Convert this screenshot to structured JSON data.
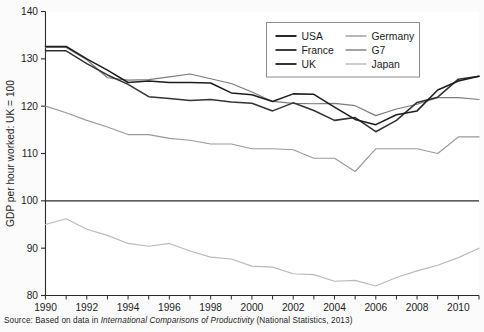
{
  "caption": {
    "prefix": "Source: Based on data in ",
    "italic_title": "International Comparisons of Productivity",
    "suffix": " (National Statistics, 2013)"
  },
  "chart_data": {
    "type": "line",
    "title": "",
    "xlabel": "",
    "ylabel": "GDP per hour worked: UK = 100",
    "xlim": [
      1990,
      2011
    ],
    "ylim": [
      80,
      140
    ],
    "yticks": [
      80,
      90,
      100,
      110,
      120,
      130,
      140
    ],
    "xticks": [
      1990,
      1992,
      1994,
      1996,
      1998,
      2000,
      2002,
      2004,
      2006,
      2008,
      2010
    ],
    "xtick_minor_step": 1,
    "grid": false,
    "legend_position": "top-center",
    "reference_line": {
      "value": 100,
      "label": "UK = 100"
    },
    "x": [
      1990,
      1991,
      1992,
      1993,
      1994,
      1995,
      1996,
      1997,
      1998,
      1999,
      2000,
      2001,
      2002,
      2003,
      2004,
      2005,
      2006,
      2007,
      2008,
      2009,
      2010,
      2011
    ],
    "series": [
      {
        "name": "USA",
        "color": "#1d1d1d",
        "values": [
          132.6,
          132.6,
          130.0,
          127.6,
          125.0,
          125.3,
          125.0,
          125.0,
          124.9,
          122.8,
          122.4,
          121.0,
          122.6,
          122.5,
          119.8,
          117.2,
          116.1,
          118.2,
          119.0,
          123.4,
          125.3,
          126.3
        ]
      },
      {
        "name": "France",
        "color": "#333333",
        "values": [
          131.7,
          131.7,
          129.0,
          126.6,
          124.6,
          122.0,
          121.6,
          121.2,
          121.4,
          120.9,
          120.6,
          119.0,
          120.7,
          119.1,
          117.0,
          117.6,
          114.6,
          117.0,
          120.8,
          121.9,
          125.7,
          126.3
        ]
      },
      {
        "name": "UK",
        "color": "#2a2a2a",
        "values": [
          100,
          100,
          100,
          100,
          100,
          100,
          100,
          100,
          100,
          100,
          100,
          100,
          100,
          100,
          100,
          100,
          100,
          100,
          100,
          100,
          100,
          100
        ]
      },
      {
        "name": "Germany",
        "color": "#9a9a9a",
        "values": [
          120.0,
          118.6,
          117.0,
          115.6,
          114.0,
          114.0,
          113.2,
          112.8,
          112.0,
          112.0,
          111.0,
          111.0,
          110.8,
          109.0,
          109.0,
          106.2,
          111.0,
          111.0,
          111.0,
          110.0,
          113.5,
          113.5
        ]
      },
      {
        "name": "G7",
        "color": "#7c7c7c",
        "values": [
          132.4,
          132.4,
          129.8,
          126.0,
          125.5,
          125.6,
          126.2,
          126.8,
          125.8,
          124.8,
          123.0,
          121.0,
          120.6,
          120.5,
          120.6,
          120.1,
          118.0,
          119.4,
          120.4,
          121.8,
          121.8,
          121.4
        ]
      },
      {
        "name": "Japan",
        "color": "#b9b9b9",
        "values": [
          95.0,
          96.2,
          94.0,
          92.7,
          91.0,
          90.4,
          91.0,
          89.4,
          88.1,
          87.7,
          86.2,
          86.0,
          84.6,
          84.4,
          83.0,
          83.2,
          82.0,
          83.8,
          85.2,
          86.4,
          88.0,
          90.0
        ]
      }
    ]
  },
  "legend": {
    "entries": [
      {
        "label": "USA",
        "series": "USA"
      },
      {
        "label": "Germany",
        "series": "Germany"
      },
      {
        "label": "France",
        "series": "France"
      },
      {
        "label": "G7",
        "series": "G7"
      },
      {
        "label": "UK",
        "series": "UK"
      },
      {
        "label": "Japan",
        "series": "Japan"
      }
    ]
  }
}
